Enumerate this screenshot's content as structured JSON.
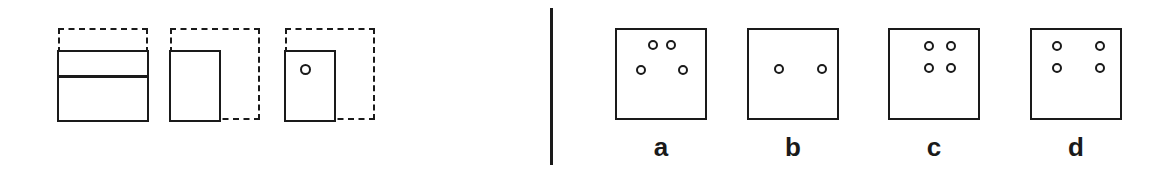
{
  "figure": {
    "background_color": "#ffffff",
    "ink_color": "#1a1a1a",
    "divider": {
      "name": "vertical-rule"
    },
    "left_panel": {
      "name": "partial-occlusion-panel",
      "items": [
        {
          "id": "ghost-figure-1",
          "ghost_outline": "dashed-square",
          "solid_shape": "wide-rectangle-split-horizontally",
          "has_marker": false,
          "marker": null
        },
        {
          "id": "ghost-figure-2",
          "ghost_outline": "dashed-square",
          "solid_shape": "left-half-rectangle",
          "has_marker": false,
          "marker": null
        },
        {
          "id": "ghost-figure-3",
          "ghost_outline": "dashed-square",
          "solid_shape": "left-half-rectangle",
          "has_marker": true,
          "marker": "small-open-circle"
        }
      ]
    },
    "right_panel": {
      "name": "dot-pattern-options",
      "options": [
        {
          "label": "a",
          "box_x": 63,
          "dot_count": 4,
          "arrangement": "trapezoid",
          "dots": [
            {
              "x": 36,
              "y": 15
            },
            {
              "x": 54,
              "y": 15
            },
            {
              "x": 24,
              "y": 40
            },
            {
              "x": 66,
              "y": 40
            }
          ]
        },
        {
          "label": "b",
          "box_x": 195,
          "dot_count": 2,
          "arrangement": "horizontal-pair",
          "dots": [
            {
              "x": 30,
              "y": 39
            },
            {
              "x": 73,
              "y": 39
            }
          ]
        },
        {
          "label": "c",
          "box_x": 336,
          "dot_count": 4,
          "arrangement": "tight-square",
          "dots": [
            {
              "x": 39,
              "y": 16
            },
            {
              "x": 61,
              "y": 16
            },
            {
              "x": 39,
              "y": 38
            },
            {
              "x": 61,
              "y": 38
            }
          ]
        },
        {
          "label": "d",
          "box_x": 478,
          "dot_count": 4,
          "arrangement": "wide-square",
          "dots": [
            {
              "x": 25,
              "y": 16
            },
            {
              "x": 68,
              "y": 16
            },
            {
              "x": 25,
              "y": 38
            },
            {
              "x": 68,
              "y": 38
            }
          ]
        }
      ]
    }
  }
}
